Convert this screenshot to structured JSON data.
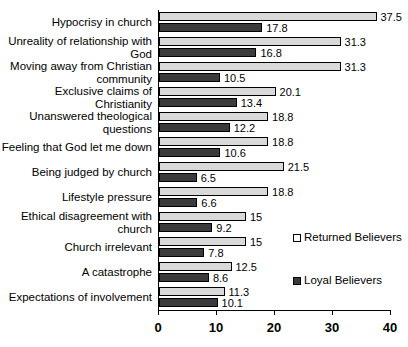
{
  "chart_data": {
    "type": "bar",
    "orientation": "horizontal",
    "title": "",
    "subtitle": "",
    "xlabel": "",
    "ylabel": "",
    "xlim": [
      0,
      40
    ],
    "xticks": [
      0,
      10,
      20,
      30,
      40
    ],
    "xtick_labels": [
      "0",
      "10",
      "20",
      "30",
      "40"
    ],
    "grid": false,
    "legend_position": "right-middle",
    "categories": [
      "Hypocrisy in church",
      "Unreality of relationship with God",
      "Moving away from Christian community",
      "Exclusive claims of Christianity",
      "Unanswered theological questions",
      "Feeling that God let me down",
      "Being judged by church",
      "Lifestyle pressure",
      "Ethical disagreement with church",
      "Church irrelevant",
      "A catastrophe",
      "Expectations of involvement"
    ],
    "category_lines": [
      [
        "Hypocrisy in church"
      ],
      [
        "Unreality of relationship with",
        "God"
      ],
      [
        "Moving away from Christian",
        "community"
      ],
      [
        "Exclusive claims of Christianity"
      ],
      [
        "Unanswered theological",
        "questions"
      ],
      [
        "Feeling that God let me down"
      ],
      [
        "Being judged by church"
      ],
      [
        "Lifestyle pressure"
      ],
      [
        "Ethical disagreement with",
        "church"
      ],
      [
        "Church irrelevant"
      ],
      [
        "A catastrophe"
      ],
      [
        "Expectations of involvement"
      ]
    ],
    "series": [
      {
        "name": "Returned Believers",
        "color": "#d9d9d9",
        "values": [
          37.5,
          31.3,
          31.3,
          20.1,
          18.8,
          18.8,
          21.5,
          18.8,
          15,
          15,
          12.5,
          11.3
        ],
        "labels": [
          "37.5",
          "31.3",
          "31.3",
          "20.1",
          "18.8",
          "18.8",
          "21.5",
          "18.8",
          "15",
          "15",
          "12.5",
          "11.3"
        ]
      },
      {
        "name": "Loyal Believers",
        "color": "#3b3b3b",
        "values": [
          17.8,
          16.8,
          10.5,
          13.4,
          12.2,
          10.6,
          6.5,
          6.6,
          9.2,
          7.8,
          8.6,
          10.1
        ],
        "labels": [
          "17.8",
          "16.8",
          "10.5",
          "13.4",
          "12.2",
          "10.6",
          "6.5",
          "6.6",
          "9.2",
          "7.8",
          "8.6",
          "10.1"
        ]
      }
    ]
  },
  "legend": {
    "entries": [
      {
        "label": "Returned Believers",
        "key": "returned"
      },
      {
        "label": "Loyal Believers",
        "key": "loyal"
      }
    ]
  }
}
